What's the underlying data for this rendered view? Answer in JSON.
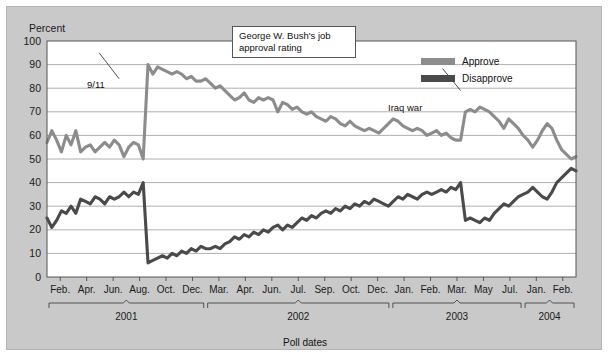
{
  "figure": {
    "title": "George W. Bush's job approval rating",
    "title_line1": "George W. Bush's job",
    "title_line2": "approval rating",
    "ylabel": "Percent",
    "xlabel": "Poll dates",
    "bg_color": "#c9c9c9",
    "plot_bg_color": "#ffffff"
  },
  "legend": {
    "position": "top-right",
    "items": [
      {
        "label": "Approve",
        "color": "#8c8c8c"
      },
      {
        "label": "Disapprove",
        "color": "#4a4a4a"
      }
    ]
  },
  "annotations": [
    {
      "name": "9/11",
      "text": "9/11",
      "x_index": 15,
      "y_value": 84
    },
    {
      "name": "Iraq war",
      "text": "Iraq war",
      "x_index": 86,
      "y_value": 79
    }
  ],
  "axes": {
    "y_ticks": [
      0,
      10,
      20,
      30,
      40,
      50,
      60,
      70,
      80,
      90,
      100
    ],
    "y_min": 0,
    "y_max": 100,
    "x_tick_labels": [
      "Feb.",
      "Apr.",
      "Jun.",
      "Aug.",
      "Oct.",
      "Dec.",
      "Mar.",
      "Apr.",
      "Jun.",
      "Jul.",
      "Sep.",
      "Oct.",
      "Dec.",
      "Jan.",
      "Feb.",
      "Mar.",
      "May",
      "Jul.",
      "Jan.",
      "Feb."
    ],
    "year_groups": [
      {
        "label": "2001",
        "start_tick": 0,
        "end_tick": 5
      },
      {
        "label": "2002",
        "start_tick": 6,
        "end_tick": 12
      },
      {
        "label": "2003",
        "start_tick": 13,
        "end_tick": 17
      },
      {
        "label": "2004",
        "start_tick": 18,
        "end_tick": 19
      }
    ],
    "grid": "horizontal"
  },
  "chart_data": {
    "type": "line",
    "title": "George W. Bush's job approval rating",
    "xlabel": "Poll dates",
    "ylabel": "Percent",
    "ylim": [
      0,
      100
    ],
    "grid": "horizontal",
    "legend_position": "top-right",
    "x_tick_labels": [
      "Feb.",
      "Apr.",
      "Jun.",
      "Aug.",
      "Oct.",
      "Dec.",
      "Mar.",
      "Apr.",
      "Jun.",
      "Jul.",
      "Sep.",
      "Oct.",
      "Dec.",
      "Jan.",
      "Feb.",
      "Mar.",
      "May",
      "Jul.",
      "Jan.",
      "Feb."
    ],
    "series": [
      {
        "name": "Approve",
        "color": "#8c8c8c",
        "values": [
          57,
          62,
          58,
          53,
          60,
          56,
          62,
          53,
          55,
          56,
          53,
          55,
          57,
          55,
          58,
          56,
          51,
          55,
          57,
          56,
          50,
          90,
          86,
          89,
          88,
          87,
          86,
          87,
          86,
          84,
          85,
          83,
          83,
          84,
          82,
          80,
          81,
          79,
          77,
          75,
          76,
          78,
          75,
          74,
          76,
          75,
          76,
          75,
          70,
          74,
          73,
          71,
          72,
          70,
          69,
          70,
          68,
          67,
          66,
          68,
          67,
          65,
          64,
          66,
          64,
          63,
          62,
          63,
          62,
          61,
          63,
          65,
          67,
          66,
          64,
          63,
          62,
          63,
          62,
          60,
          61,
          62,
          60,
          61,
          59,
          58,
          58,
          70,
          71,
          70,
          72,
          71,
          70,
          68,
          66,
          63,
          67,
          65,
          63,
          60,
          58,
          55,
          58,
          62,
          65,
          63,
          58,
          54,
          52,
          50,
          51
        ]
      },
      {
        "name": "Disapprove",
        "color": "#4a4a4a",
        "values": [
          25,
          21,
          24,
          28,
          27,
          30,
          27,
          33,
          32,
          31,
          34,
          33,
          31,
          34,
          33,
          34,
          36,
          34,
          36,
          35,
          40,
          6,
          7,
          8,
          9,
          8,
          10,
          9,
          11,
          10,
          12,
          11,
          13,
          12,
          12,
          13,
          12,
          14,
          15,
          17,
          16,
          18,
          17,
          19,
          18,
          20,
          19,
          21,
          22,
          20,
          22,
          21,
          23,
          25,
          24,
          26,
          25,
          27,
          28,
          27,
          29,
          28,
          30,
          29,
          31,
          30,
          32,
          31,
          33,
          32,
          31,
          30,
          32,
          34,
          33,
          35,
          34,
          33,
          35,
          36,
          35,
          36,
          37,
          36,
          38,
          37,
          40,
          24,
          25,
          24,
          23,
          25,
          24,
          27,
          29,
          31,
          30,
          32,
          34,
          35,
          36,
          38,
          36,
          34,
          33,
          36,
          40,
          42,
          44,
          46,
          45
        ]
      }
    ]
  }
}
